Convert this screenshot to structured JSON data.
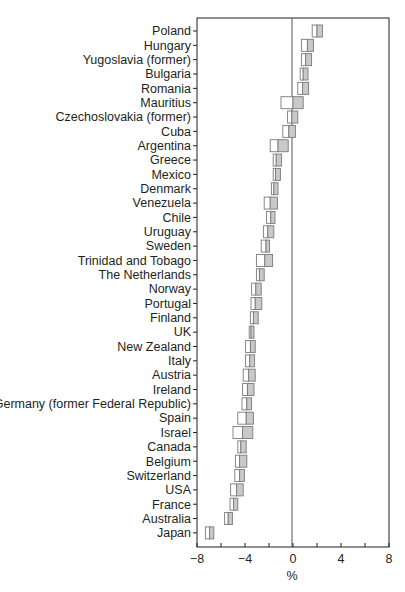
{
  "chart_data": {
    "type": "interval",
    "title": "",
    "xlabel": "%",
    "ylabel": "",
    "xlim": [
      -8,
      8
    ],
    "xticks": [
      -8,
      -4,
      0,
      4,
      8
    ],
    "minor_xticks": [
      -6,
      -2,
      2,
      6
    ],
    "grid": false,
    "legend": null,
    "reference_line": 0,
    "categories": [
      "Poland",
      "Hungary",
      "Yugoslavia (former)",
      "Bulgaria",
      "Romania",
      "Mauritius",
      "Czechoslovakia (former)",
      "Cuba",
      "Argentina",
      "Greece",
      "Mexico",
      "Denmark",
      "Venezuela",
      "Chile",
      "Uruguay",
      "Sweden",
      "Trinidad and Tobago",
      "The Netherlands",
      "Norway",
      "Portugal",
      "Finland",
      "UK",
      "New Zealand",
      "Italy",
      "Austria",
      "Ireland",
      "Germany (former Federal Republic)",
      "Spain",
      "Israel",
      "Canada",
      "Belgium",
      "Switzerland",
      "USA",
      "France",
      "Australia",
      "Japan"
    ],
    "series": [
      {
        "name": "lower",
        "values": [
          1.6,
          0.7,
          0.7,
          0.6,
          0.4,
          -1.0,
          -0.45,
          -0.85,
          -1.9,
          -1.65,
          -1.65,
          -1.8,
          -2.4,
          -2.2,
          -2.45,
          -2.65,
          -3.05,
          -3.05,
          -3.45,
          -3.5,
          -3.55,
          -3.65,
          -3.95,
          -3.95,
          -4.15,
          -4.2,
          -4.25,
          -4.6,
          -5.0,
          -4.6,
          -4.8,
          -4.85,
          -5.2,
          -5.25,
          -5.7,
          -7.3
        ]
      },
      {
        "name": "estimate",
        "values": [
          2.0,
          1.2,
          1.05,
          0.85,
          0.8,
          0.0,
          -0.1,
          -0.35,
          -1.25,
          -1.4,
          -1.45,
          -1.6,
          -1.9,
          -1.85,
          -2.1,
          -2.25,
          -2.35,
          -2.8,
          -3.1,
          -3.15,
          -3.3,
          -3.5,
          -3.55,
          -3.6,
          -3.7,
          -3.8,
          -3.85,
          -3.9,
          -4.2,
          -4.35,
          -4.45,
          -4.45,
          -4.7,
          -4.95,
          -5.4,
          -6.95
        ]
      },
      {
        "name": "upper",
        "values": [
          2.45,
          1.7,
          1.55,
          1.25,
          1.3,
          0.85,
          0.4,
          0.2,
          -0.4,
          -0.95,
          -1.05,
          -1.25,
          -1.3,
          -1.5,
          -1.6,
          -1.95,
          -1.7,
          -2.4,
          -2.65,
          -2.6,
          -2.9,
          -3.25,
          -3.15,
          -3.2,
          -3.15,
          -3.25,
          -3.45,
          -3.3,
          -3.35,
          -3.9,
          -3.85,
          -4.05,
          -4.15,
          -4.6,
          -5.05,
          -6.6
        ]
      }
    ]
  },
  "colors": {
    "axis": "#231f20",
    "box_border": "#7a7a7a",
    "box_left_fill": "#ffffff",
    "box_right_fill": "#c9c9c9",
    "zero_line": "#555555"
  }
}
